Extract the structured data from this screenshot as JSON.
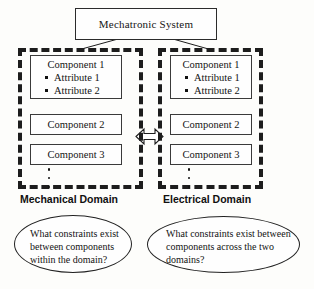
{
  "diagram": {
    "root": {
      "label": "Mechatronic System"
    },
    "domains": [
      {
        "id": "mechanical",
        "label": "Mechanical Domain",
        "components": [
          {
            "name": "Component 1",
            "attributes": [
              "Attribute 1",
              "Attribute 2"
            ]
          },
          {
            "name": "Component 2",
            "attributes": []
          },
          {
            "name": "Component 3",
            "attributes": []
          }
        ],
        "continuation": "vertical-ellipsis",
        "question": "What constraints exist between components within the domain?"
      },
      {
        "id": "electrical",
        "label": "Electrical Domain",
        "components": [
          {
            "name": "Component 1",
            "attributes": [
              "Attribute 1",
              "Attribute 2"
            ]
          },
          {
            "name": "Component 2",
            "attributes": []
          },
          {
            "name": "Component 3",
            "attributes": []
          }
        ],
        "continuation": "vertical-ellipsis",
        "question": "What constraints exist between components across the two domains?"
      }
    ],
    "cross_domain_link": {
      "icon": "double-headed-arrow-horizontal"
    },
    "colors": {
      "ink": "#1d1d1d",
      "box_border": "#3a3a3a",
      "background": "#fdfdfb"
    }
  }
}
